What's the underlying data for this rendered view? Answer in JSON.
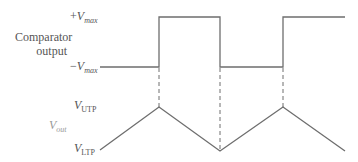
{
  "labels": {
    "vmax_pos_sign": "+",
    "vmax_neg_sign": "−",
    "v": "V",
    "max": "max",
    "comparator_line1": "Comparator",
    "comparator_line2": "output",
    "utp": "UTP",
    "ltp": "LTP",
    "out": "out"
  },
  "colors": {
    "line": "#6e6e6e",
    "text": "#555555",
    "vout": "#999999"
  },
  "diagram": {
    "square_wave": [
      [
        100,
        67
      ],
      [
        159,
        67
      ],
      [
        159,
        17
      ],
      [
        220,
        17
      ],
      [
        220,
        67
      ],
      [
        283,
        67
      ],
      [
        283,
        17
      ],
      [
        345,
        17
      ]
    ],
    "triangle_wave": [
      [
        100,
        150
      ],
      [
        159,
        107
      ],
      [
        220,
        151
      ],
      [
        283,
        107
      ],
      [
        345,
        151
      ]
    ],
    "dashed_lines_x": [
      159,
      220,
      283
    ]
  }
}
